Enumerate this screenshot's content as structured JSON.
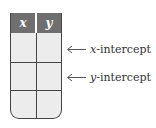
{
  "table": {
    "headers": [
      "x",
      "y"
    ],
    "rows": [
      [
        "",
        ""
      ],
      [
        "",
        ""
      ],
      [
        "",
        ""
      ]
    ]
  },
  "annotations": [
    {
      "var": "x",
      "text": "-intercept",
      "row": 1
    },
    {
      "var": "y",
      "text": "-intercept",
      "row": 2
    }
  ]
}
